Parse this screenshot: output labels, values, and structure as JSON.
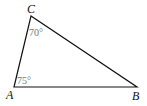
{
  "diagram": {
    "type": "triangle",
    "vertices": {
      "A": {
        "label": "A",
        "x": 14,
        "y": 87
      },
      "B": {
        "label": "B",
        "x": 137,
        "y": 87
      },
      "C": {
        "label": "C",
        "x": 31,
        "y": 16
      }
    },
    "angles": {
      "A": "75°",
      "C": "70°"
    },
    "colors": {
      "stroke": "#111111",
      "angle_text": "#777777"
    }
  }
}
